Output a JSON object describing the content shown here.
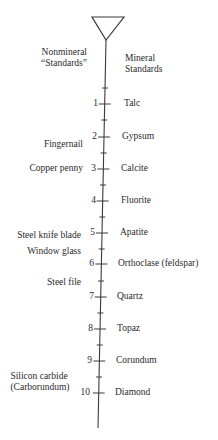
{
  "headers": {
    "left_line1": "Nonmineral",
    "left_line2": "“Standards”",
    "right_line1": "Mineral",
    "right_line2": "Standards"
  },
  "scale": [
    {
      "value": "1",
      "mineral": "Talc"
    },
    {
      "value": "2",
      "mineral": "Gypsum"
    },
    {
      "value": "3",
      "mineral": "Calcite"
    },
    {
      "value": "4",
      "mineral": "Fluorite"
    },
    {
      "value": "5",
      "mineral": "Apatite"
    },
    {
      "value": "6",
      "mineral": "Orthoclase (feldspar)"
    },
    {
      "value": "7",
      "mineral": "Quartz"
    },
    {
      "value": "8",
      "mineral": "Topaz"
    },
    {
      "value": "9",
      "mineral": "Corundum"
    },
    {
      "value": "10",
      "mineral": "Diamond"
    }
  ],
  "nonmineral": [
    {
      "label": "Fingernail",
      "hardness": 2.5
    },
    {
      "label": "Copper penny",
      "hardness": 3
    },
    {
      "label": "Steel knife blade",
      "hardness": 5
    },
    {
      "label": "Window glass",
      "hardness": 5.5
    },
    {
      "label": "Steel file",
      "hardness": 6.5
    },
    {
      "label": "Silicon carbide",
      "hardness": 9.5
    },
    {
      "label": "(Carborundum)",
      "hardness": 9.5
    }
  ],
  "colors": {
    "ink": "#2a2a2a",
    "background": "#ffffff"
  }
}
